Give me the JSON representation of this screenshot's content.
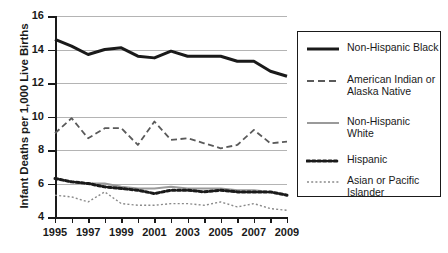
{
  "chart_data": {
    "type": "line",
    "title": "",
    "xlabel": "",
    "ylabel": "Infant Deaths per 1,000 Live Births",
    "x": [
      1995,
      1996,
      1997,
      1998,
      1999,
      2000,
      2001,
      2002,
      2003,
      2004,
      2005,
      2006,
      2007,
      2008,
      2009
    ],
    "xlim": [
      1995,
      2009
    ],
    "ylim": [
      4,
      16
    ],
    "yticks": [
      4,
      6,
      8,
      10,
      12,
      14,
      16
    ],
    "xticklabels": [
      "1995",
      "1997",
      "1999",
      "2001",
      "2003",
      "2005",
      "2007",
      "2009"
    ],
    "xticklabel_years": [
      1995,
      1997,
      1999,
      2001,
      2003,
      2005,
      2007,
      2009
    ],
    "grid": "horizontal",
    "legend_position": "right",
    "series": [
      {
        "name": "Non-Hispanic Black",
        "style": "solid",
        "color": "#1a1a1a",
        "width": 3.0,
        "values": [
          14.6,
          14.2,
          13.7,
          14.0,
          14.1,
          13.6,
          13.5,
          13.9,
          13.6,
          13.6,
          13.6,
          13.3,
          13.3,
          12.7,
          12.4
        ]
      },
      {
        "name": "American Indian or Alaska Native",
        "style": "dashed",
        "color": "#5a5a5a",
        "width": 1.8,
        "values": [
          9.0,
          9.9,
          8.7,
          9.3,
          9.3,
          8.3,
          9.7,
          8.6,
          8.7,
          8.4,
          8.1,
          8.3,
          9.2,
          8.4,
          8.5
        ]
      },
      {
        "name": "Non-Hispanic White",
        "style": "solid",
        "color": "#9a9a9a",
        "width": 2.0,
        "values": [
          6.3,
          6.1,
          6.0,
          6.0,
          5.8,
          5.7,
          5.7,
          5.8,
          5.7,
          5.7,
          5.7,
          5.6,
          5.6,
          5.5,
          5.3
        ]
      },
      {
        "name": "Hispanic",
        "style": "dotted",
        "color": "#1a1a1a",
        "width": 3.0,
        "values": [
          6.3,
          6.1,
          6.0,
          5.8,
          5.7,
          5.6,
          5.4,
          5.6,
          5.6,
          5.5,
          5.6,
          5.5,
          5.5,
          5.5,
          5.3
        ]
      },
      {
        "name": "Asian or Pacific Islander",
        "style": "fine-dotted",
        "color": "#8a8a8a",
        "width": 1.4,
        "values": [
          5.3,
          5.2,
          4.9,
          5.5,
          4.8,
          4.7,
          4.7,
          4.8,
          4.8,
          4.7,
          4.9,
          4.6,
          4.8,
          4.5,
          4.4
        ]
      }
    ]
  },
  "legend": {
    "items": [
      {
        "label_line1": "Non-Hispanic Black",
        "label_line2": ""
      },
      {
        "label_line1": "American Indian or",
        "label_line2": "Alaska Native"
      },
      {
        "label_line1": "Non-Hispanic",
        "label_line2": "White"
      },
      {
        "label_line1": "Hispanic",
        "label_line2": ""
      },
      {
        "label_line1": "Asian or Pacific",
        "label_line2": "Islander"
      }
    ]
  }
}
